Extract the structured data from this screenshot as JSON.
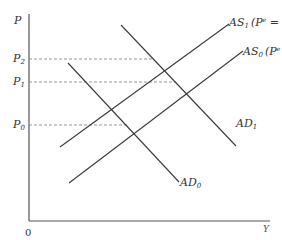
{
  "diagram": {
    "y_axis_label": "P",
    "x_axis_label": "Y",
    "origin_label": "0",
    "price_levels": [
      {
        "id": "P2",
        "label_main": "P",
        "label_sub": "2"
      },
      {
        "id": "P1",
        "label_main": "P",
        "label_sub": "1"
      },
      {
        "id": "P0",
        "label_main": "P",
        "label_sub": "0"
      }
    ],
    "curves": {
      "as1": {
        "label_main": "AS",
        "label_sub": "1",
        "label_note": "(P",
        "label_note_sup": "e",
        "label_note_end": " = P",
        "label_note_sub": "1",
        "label_close": ")"
      },
      "as0": {
        "label_main": "AS",
        "label_sub": "0",
        "label_note": "(P",
        "label_note_sup": "e",
        "label_note_end": " = P",
        "label_note_sub": "0",
        "label_close": ")"
      },
      "ad1": {
        "label_main": "AD",
        "label_sub": "1"
      },
      "ad0": {
        "label_main": "AD",
        "label_sub": "0"
      }
    },
    "colors": {
      "line": "#3a3a3a",
      "guide": "#8a8a8a",
      "background": "#ffffff"
    }
  }
}
